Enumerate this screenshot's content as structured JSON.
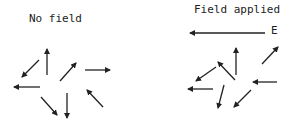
{
  "panels": {
    "left": {
      "title": "No field",
      "arrows": [
        {
          "from": [
            47,
            75
          ],
          "to": [
            47,
            49
          ]
        },
        {
          "from": [
            39,
            60
          ],
          "to": [
            22,
            77
          ]
        },
        {
          "from": [
            40,
            87
          ],
          "to": [
            14,
            87
          ]
        },
        {
          "from": [
            60,
            81
          ],
          "to": [
            76,
            63
          ]
        },
        {
          "from": [
            85,
            70
          ],
          "to": [
            110,
            70
          ]
        },
        {
          "from": [
            41,
            97
          ],
          "to": [
            57,
            115
          ]
        },
        {
          "from": [
            67,
            93
          ],
          "to": [
            67,
            118
          ]
        },
        {
          "from": [
            103,
            107
          ],
          "to": [
            87,
            90
          ]
        }
      ]
    },
    "right": {
      "title": "Field applied",
      "field_label": "E",
      "field_arrow": {
        "from": [
          265,
          33
        ],
        "to": [
          190,
          33
        ]
      },
      "arrows": [
        {
          "from": [
            236,
            75
          ],
          "to": [
            236,
            48
          ]
        },
        {
          "from": [
            235,
            80
          ],
          "to": [
            218,
            62
          ]
        },
        {
          "from": [
            216,
            67
          ],
          "to": [
            196,
            81
          ]
        },
        {
          "from": [
            213,
            89
          ],
          "to": [
            188,
            89
          ]
        },
        {
          "from": [
            224,
            85
          ],
          "to": [
            218,
            108
          ]
        },
        {
          "from": [
            251,
            90
          ],
          "to": [
            234,
            107
          ]
        },
        {
          "from": [
            277,
            82
          ],
          "to": [
            253,
            82
          ]
        },
        {
          "from": [
            262,
            64
          ],
          "to": [
            278,
            47
          ]
        }
      ]
    }
  },
  "colors": {
    "ink": "#222222",
    "background": "#ffffff"
  }
}
